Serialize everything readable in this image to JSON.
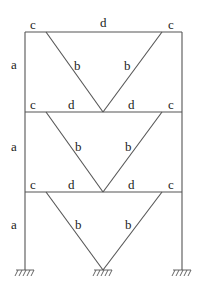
{
  "diagram": {
    "type": "braced-frame",
    "storeys": 3,
    "colors": {
      "line": "#555555",
      "text": "#222222",
      "background": "#ffffff"
    },
    "labels": {
      "column": "a",
      "brace": "b",
      "beam_end": "c",
      "beam_mid": "d"
    },
    "storey_labels": [
      {
        "column": "a",
        "brace_left": "b",
        "brace_right": "b",
        "beam_left_end": "c",
        "beam_mid": "d",
        "beam_right_end": "c"
      },
      {
        "column": "a",
        "brace_left": "b",
        "brace_right": "b",
        "beam_left_end": "c",
        "beam_mid_left": "d",
        "beam_mid_right": "d",
        "beam_right_end": "c"
      },
      {
        "column": "a",
        "brace_left": "b",
        "brace_right": "b",
        "beam_left_end": "c",
        "beam_mid_left": "d",
        "beam_mid_right": "d",
        "beam_right_end": "c"
      }
    ],
    "supports": [
      "fixed-left",
      "fixed-center",
      "fixed-right"
    ]
  }
}
